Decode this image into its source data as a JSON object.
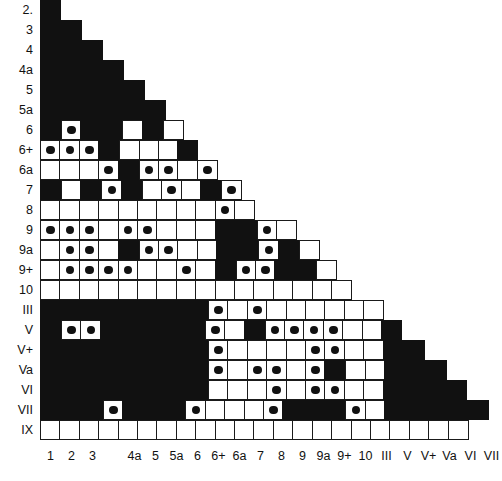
{
  "figure": {
    "name": "symmetric-association-matrix",
    "colors": {
      "filled": "#111111",
      "empty": "#ffffff",
      "line": "#1a1a1a",
      "dot": "#111111"
    }
  },
  "axes": {
    "row_labels": [
      "2.",
      "3",
      "4",
      "4a",
      "5",
      "5a",
      "6",
      "6+",
      "6a",
      "7",
      "8",
      "9",
      "9a",
      "9+",
      "10",
      "III",
      "V",
      "V+",
      "Va",
      "VI",
      "VII",
      "IX"
    ],
    "col_labels": [
      "1",
      "2",
      "3",
      "",
      "4a",
      "5",
      "5a",
      "6",
      "6+",
      "6a",
      "7",
      "8",
      "9",
      "9a",
      "9+",
      "10",
      "III",
      "V",
      "V+",
      "Va",
      "VI",
      "VII"
    ]
  },
  "chart_data": {
    "type": "heatmap",
    "title": "",
    "xlabel": "",
    "ylabel": "",
    "grid": true,
    "legend": "none",
    "cell_states": [
      "black",
      "white",
      "dot",
      "empty"
    ],
    "categories": [
      "1",
      "2",
      "3",
      "",
      "4a",
      "5",
      "5a",
      "6",
      "6+",
      "6a",
      "7",
      "8",
      "9",
      "9a",
      "9+",
      "10",
      "III",
      "V",
      "V+",
      "Va",
      "VI",
      "VII"
    ],
    "rows": [
      {
        "label": "2.",
        "cells": [
          "black"
        ]
      },
      {
        "label": "3",
        "cells": [
          "black",
          "black"
        ]
      },
      {
        "label": "4",
        "cells": [
          "black",
          "black",
          "black"
        ]
      },
      {
        "label": "4a",
        "cells": [
          "black",
          "black",
          "black",
          "black"
        ]
      },
      {
        "label": "5",
        "cells": [
          "black",
          "black",
          "black",
          "black",
          "black"
        ]
      },
      {
        "label": "5a",
        "cells": [
          "black",
          "black",
          "black",
          "black",
          "black",
          "black"
        ]
      },
      {
        "label": "6",
        "cells": [
          "black",
          "dot",
          "black",
          "black",
          "white",
          "black",
          "white"
        ]
      },
      {
        "label": "6+",
        "cells": [
          "dot",
          "dot",
          "dot",
          "black",
          "white",
          "white",
          "white",
          "black"
        ]
      },
      {
        "label": "6a",
        "cells": [
          "white",
          "white",
          "white",
          "dot",
          "black",
          "dot",
          "dot",
          "white",
          "dot"
        ]
      },
      {
        "label": "7",
        "cells": [
          "black",
          "white",
          "black",
          "dot",
          "black",
          "white",
          "dot",
          "white",
          "black",
          "dot"
        ]
      },
      {
        "label": "8",
        "cells": [
          "white",
          "white",
          "white",
          "white",
          "white",
          "white",
          "white",
          "white",
          "white",
          "dot",
          "white"
        ]
      },
      {
        "label": "9",
        "cells": [
          "dot",
          "dot",
          "dot",
          "white",
          "dot",
          "dot",
          "white",
          "white",
          "white",
          "black",
          "black",
          "dot",
          "white"
        ]
      },
      {
        "label": "9a",
        "cells": [
          "white",
          "dot",
          "dot",
          "white",
          "black",
          "dot",
          "dot",
          "white",
          "white",
          "black",
          "black",
          "dot",
          "black",
          "white"
        ]
      },
      {
        "label": "9+",
        "cells": [
          "white",
          "dot",
          "dot",
          "dot",
          "dot",
          "white",
          "white",
          "dot",
          "white",
          "black",
          "dot",
          "dot",
          "black",
          "black",
          "white"
        ]
      },
      {
        "label": "10",
        "cells": [
          "white",
          "white",
          "white",
          "white",
          "white",
          "white",
          "white",
          "white",
          "white",
          "white",
          "white",
          "white",
          "white",
          "white",
          "white",
          "white"
        ]
      },
      {
        "label": "III",
        "cells": [
          "black",
          "black",
          "black",
          "black",
          "black",
          "black",
          "black",
          "black",
          "dot",
          "white",
          "dot",
          "white",
          "white",
          "white",
          "white",
          "white",
          "white"
        ]
      },
      {
        "label": "V",
        "cells": [
          "black",
          "dot",
          "dot",
          "black",
          "black",
          "black",
          "black",
          "black",
          "dot",
          "white",
          "black",
          "dot",
          "dot",
          "dot",
          "dot",
          "white",
          "white",
          "black"
        ]
      },
      {
        "label": "V+",
        "cells": [
          "black",
          "black",
          "black",
          "black",
          "black",
          "black",
          "black",
          "black",
          "dot",
          "white",
          "white",
          "white",
          "white",
          "dot",
          "dot",
          "white",
          "white",
          "black",
          "black"
        ]
      },
      {
        "label": "Va",
        "cells": [
          "black",
          "black",
          "black",
          "black",
          "black",
          "black",
          "black",
          "black",
          "dot",
          "white",
          "dot",
          "dot",
          "white",
          "dot",
          "black",
          "white",
          "white",
          "black",
          "black",
          "black"
        ]
      },
      {
        "label": "VI",
        "cells": [
          "black",
          "black",
          "black",
          "black",
          "black",
          "black",
          "black",
          "black",
          "white",
          "white",
          "white",
          "dot",
          "white",
          "dot",
          "dot",
          "white",
          "white",
          "black",
          "black",
          "black",
          "black"
        ]
      },
      {
        "label": "VII",
        "cells": [
          "black",
          "black",
          "black",
          "dot",
          "black",
          "black",
          "black",
          "dot",
          "white",
          "white",
          "white",
          "dot",
          "black",
          "black",
          "black",
          "dot",
          "white",
          "black",
          "black",
          "black",
          "black",
          "black"
        ]
      },
      {
        "label": "IX",
        "cells": [
          "white",
          "white",
          "white",
          "white",
          "white",
          "white",
          "white",
          "white",
          "white",
          "white",
          "white",
          "white",
          "white",
          "white",
          "white",
          "white",
          "white",
          "white",
          "white",
          "white",
          "white",
          "white"
        ]
      }
    ]
  }
}
